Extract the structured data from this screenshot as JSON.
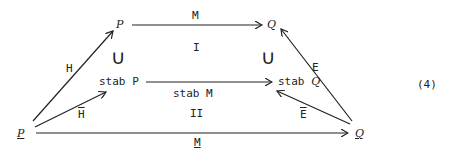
{
  "diagram": {
    "equation_number": "(4)",
    "nodes": {
      "P": "P",
      "Q": "Q",
      "stab_P_prefix": "stab",
      "stab_P_var": "P",
      "stab_Q_prefix": "stab",
      "stab_Q_var": "Q",
      "P_under": "P",
      "Q_under": "Q"
    },
    "arrows": {
      "M": "M",
      "stab_M": "stab M",
      "M_under": "M",
      "H": "H",
      "H_bar": "H",
      "E": "E",
      "E_bar": "E"
    },
    "regions": {
      "top": "I",
      "bottom": "II"
    },
    "subset_symbol": "∪"
  }
}
